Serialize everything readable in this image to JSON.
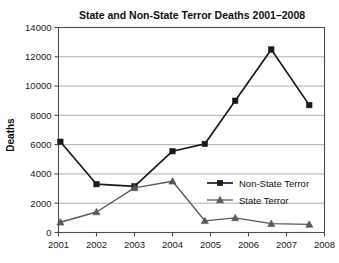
{
  "chart_data": {
    "type": "line",
    "title": "State and Non-State Terror Deaths 2001–2008",
    "xlabel": "",
    "ylabel": "Deaths",
    "categories": [
      "2001",
      "2002",
      "2003",
      "2004",
      "2005",
      "2006",
      "2007",
      "2008"
    ],
    "x": [
      2001,
      2002,
      2003,
      2004,
      2005,
      2006,
      2007,
      2008
    ],
    "ylim": [
      0,
      14000
    ],
    "xlim": [
      2001,
      2008
    ],
    "ytick_labels": [
      "0",
      "2000",
      "4000",
      "6000",
      "8000",
      "10000",
      "12000",
      "14000"
    ],
    "ytick_values": [
      0,
      2000,
      4000,
      6000,
      8000,
      10000,
      12000,
      14000
    ],
    "grid": true,
    "grid_axis": "y",
    "legend_position": "inside-right-lower",
    "series": [
      {
        "name": "Non-State Terror",
        "marker": "square",
        "color": "#1a1a1a",
        "x": [
          2001.05,
          2002.0,
          2003.0,
          2004.0,
          2004.85,
          2005.65,
          2006.6,
          2007.6
        ],
        "values": [
          6200,
          3300,
          3150,
          5550,
          6050,
          9000,
          12500,
          8700
        ]
      },
      {
        "name": "State Terror",
        "marker": "triangle",
        "color": "#595959",
        "x": [
          2001.05,
          2002.0,
          2003.0,
          2004.0,
          2004.85,
          2005.65,
          2006.6,
          2007.6
        ],
        "values": [
          700,
          1400,
          3050,
          3500,
          800,
          1000,
          600,
          550
        ]
      }
    ]
  },
  "legend": {
    "entries": [
      {
        "label": "Non-State Terror"
      },
      {
        "label": "State Terror"
      }
    ]
  }
}
